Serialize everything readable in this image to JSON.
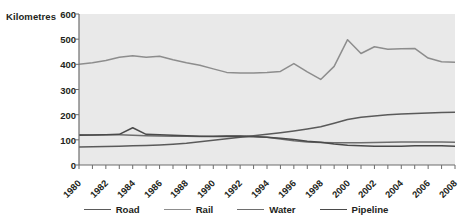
{
  "chart_data": {
    "type": "line",
    "title": "",
    "xlabel": "",
    "ylabel": "Kilometres",
    "ylim": [
      0,
      600
    ],
    "ytick_step": 100,
    "yticks": [
      600,
      500,
      400,
      300,
      200,
      100,
      0
    ],
    "grid": false,
    "legend_position": "bottom",
    "x": [
      1980,
      1981,
      1982,
      1983,
      1984,
      1985,
      1986,
      1987,
      1988,
      1989,
      1990,
      1991,
      1992,
      1993,
      1994,
      1995,
      1996,
      1997,
      1998,
      1999,
      2000,
      2001,
      2002,
      2003,
      2004,
      2005,
      2006,
      2007,
      2008
    ],
    "xtick_labels": [
      "1980",
      "1982",
      "1984",
      "1986",
      "1988",
      "1990",
      "1992",
      "1994",
      "1996",
      "1998",
      "2000",
      "2002",
      "2004",
      "2006",
      "2008"
    ],
    "xlim": [
      1980,
      2008
    ],
    "series": [
      {
        "name": "Road",
        "color": "#5a5a5a",
        "values": [
          72,
          73,
          74,
          75,
          76,
          77,
          79,
          82,
          86,
          92,
          98,
          104,
          110,
          116,
          122,
          128,
          135,
          143,
          152,
          166,
          181,
          190,
          195,
          200,
          203,
          205,
          207,
          209,
          210
        ]
      },
      {
        "name": "Rail",
        "color": "#8d8d8d",
        "values": [
          400,
          406,
          415,
          428,
          434,
          428,
          432,
          418,
          406,
          396,
          382,
          368,
          366,
          366,
          368,
          372,
          403,
          370,
          340,
          392,
          498,
          443,
          470,
          460,
          462,
          463,
          425,
          410,
          408
        ]
      },
      {
        "name": "Water",
        "color": "#6e6e6e",
        "values": [
          120,
          119,
          120,
          120,
          118,
          116,
          115,
          114,
          114,
          113,
          114,
          116,
          116,
          114,
          110,
          103,
          96,
          91,
          89,
          88,
          88,
          88,
          89,
          90,
          91,
          91,
          91,
          91,
          90
        ]
      },
      {
        "name": "Pipeline",
        "color": "#4a4a4a",
        "values": [
          118,
          119,
          120,
          122,
          148,
          122,
          120,
          118,
          116,
          114,
          113,
          113,
          113,
          112,
          110,
          106,
          101,
          94,
          90,
          83,
          78,
          76,
          75,
          75,
          75,
          76,
          76,
          76,
          75
        ]
      }
    ]
  },
  "legend": {
    "items": [
      {
        "label": "Road",
        "color": "#5a5a5a"
      },
      {
        "label": "Rail",
        "color": "#8d8d8d"
      },
      {
        "label": "Water",
        "color": "#6e6e6e"
      },
      {
        "label": "Pipeline",
        "color": "#4a4a4a"
      }
    ]
  }
}
